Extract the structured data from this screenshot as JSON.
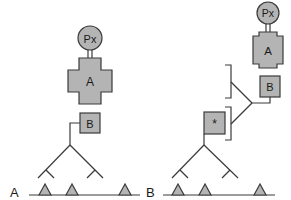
{
  "panels": [
    {
      "label": "A",
      "nodes": {
        "circle": "Px",
        "cross": "A",
        "box": "B"
      },
      "triangles": 3
    },
    {
      "label": "B",
      "nodes": {
        "circle": "Px",
        "cross": "A",
        "box": "B",
        "star_box": "*"
      },
      "brackets": 2,
      "triangles": 3
    }
  ],
  "colors": {
    "shape_fill": "#b4b4b4",
    "stroke": "#3a3a3a",
    "background": "#ffffff"
  }
}
